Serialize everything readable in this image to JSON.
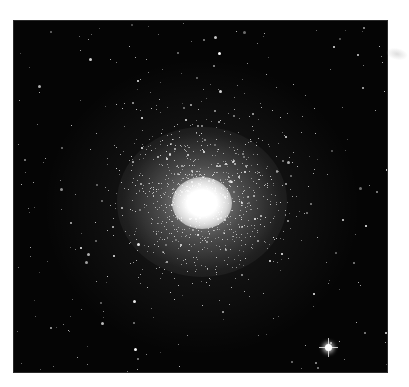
{
  "image": {
    "subject": "Globular star cluster photograph",
    "background_color": "#050505",
    "star_color": "#ffffff",
    "cluster_core": {
      "x": 202,
      "y": 197
    },
    "bright_star": {
      "x": 328,
      "y": 347
    },
    "caption": ""
  },
  "stars": {
    "seed": 42,
    "field_count": 260,
    "cluster_count": 900
  }
}
